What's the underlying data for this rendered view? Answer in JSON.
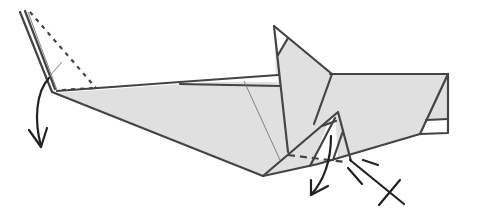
{
  "diagram": {
    "colors": {
      "paper_fill": "#e0e0e0",
      "edge": "#444444",
      "arrow": "#222222",
      "background": "#ffffff"
    },
    "symbols": [
      {
        "name": "valley-fold-arrow-left",
        "description": "curved arrow pointing down at left tip"
      },
      {
        "name": "valley-fold-arrow-bottom",
        "description": "curved arrow pointing down-left under head"
      },
      {
        "name": "x-ray-cross",
        "description": "X mark at end of reference line"
      },
      {
        "name": "valley-fold-line-left",
        "description": "dashed line on left flap"
      },
      {
        "name": "valley-fold-line-bottom",
        "description": "dashed line across lower triangle"
      }
    ]
  }
}
